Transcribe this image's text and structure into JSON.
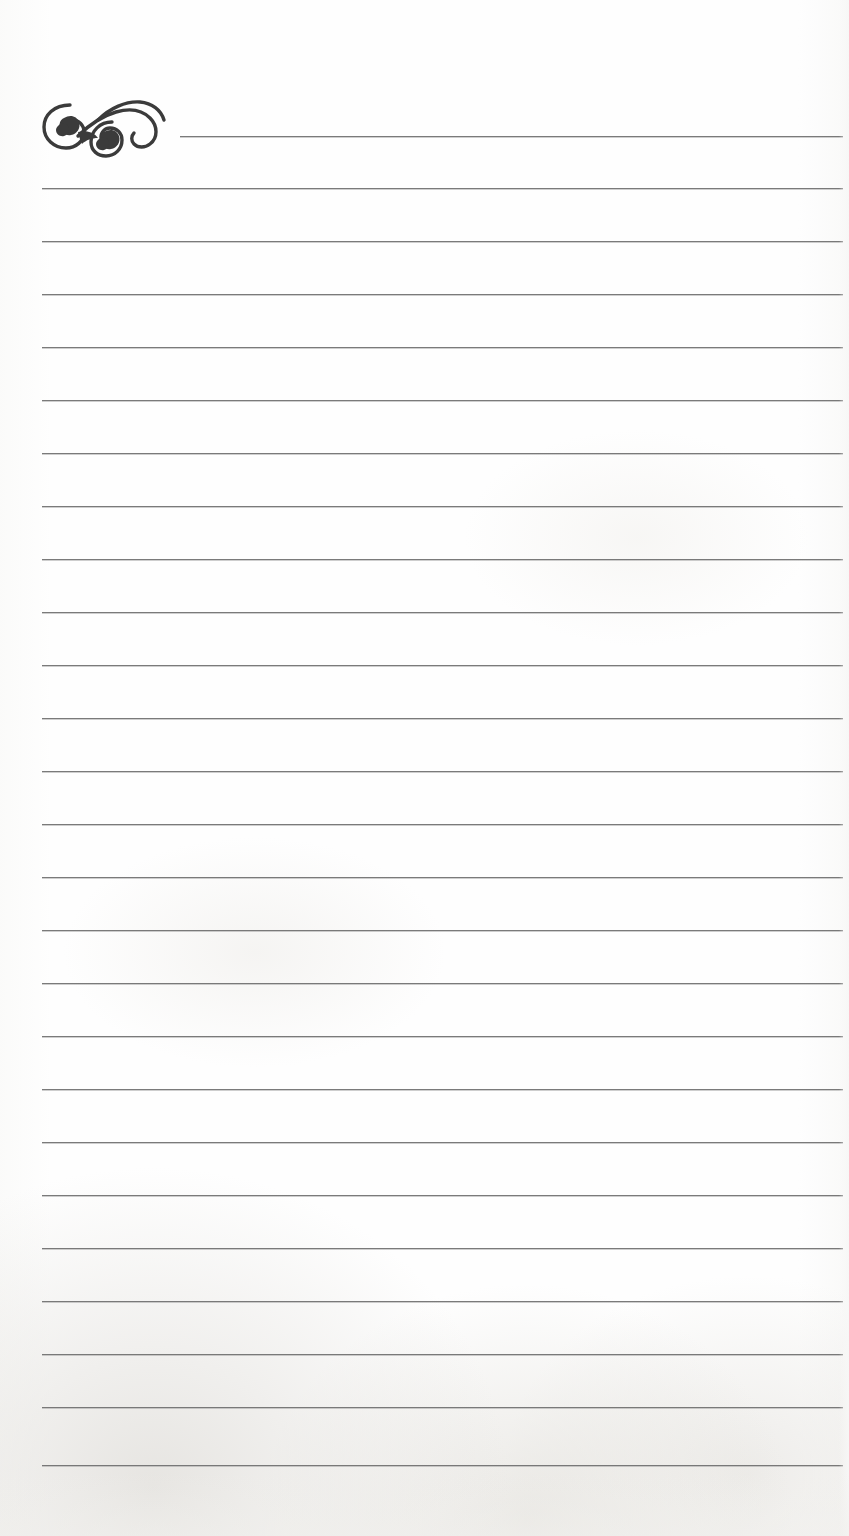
{
  "document": {
    "title": "Lined Notepaper",
    "type": "blank-ruled-writing-page",
    "background_color": "#fefefe",
    "rule_color": "#6f6f6f",
    "ornament_color": "#3b3b3b",
    "width": 849,
    "height": 1536
  },
  "ornament": {
    "name": "decorative-scroll-flourish",
    "description": "Double spiral scroll / filigree flourish with two curled bulbs",
    "x": 40,
    "y": 96,
    "width": 132,
    "height": 62
  },
  "rules": {
    "count": 26,
    "left_margin": 42,
    "right_margin": 843,
    "first_line_left": 180,
    "first_line_y": 136,
    "spacing": 53.2,
    "lines": [
      {
        "y": 136,
        "x1": 180,
        "x2": 843
      },
      {
        "y": 188,
        "x1": 42,
        "x2": 843
      },
      {
        "y": 241,
        "x1": 42,
        "x2": 843
      },
      {
        "y": 294,
        "x1": 42,
        "x2": 843
      },
      {
        "y": 347,
        "x1": 42,
        "x2": 843
      },
      {
        "y": 400,
        "x1": 42,
        "x2": 843
      },
      {
        "y": 453,
        "x1": 42,
        "x2": 843
      },
      {
        "y": 506,
        "x1": 42,
        "x2": 843
      },
      {
        "y": 559,
        "x1": 42,
        "x2": 843
      },
      {
        "y": 612,
        "x1": 42,
        "x2": 843
      },
      {
        "y": 665,
        "x1": 42,
        "x2": 843
      },
      {
        "y": 718,
        "x1": 42,
        "x2": 843
      },
      {
        "y": 771,
        "x1": 42,
        "x2": 843
      },
      {
        "y": 824,
        "x1": 42,
        "x2": 843
      },
      {
        "y": 877,
        "x1": 42,
        "x2": 843
      },
      {
        "y": 930,
        "x1": 42,
        "x2": 843
      },
      {
        "y": 983,
        "x1": 42,
        "x2": 843
      },
      {
        "y": 1036,
        "x1": 42,
        "x2": 843
      },
      {
        "y": 1089,
        "x1": 42,
        "x2": 843
      },
      {
        "y": 1142,
        "x1": 42,
        "x2": 843
      },
      {
        "y": 1195,
        "x1": 42,
        "x2": 843
      },
      {
        "y": 1248,
        "x1": 42,
        "x2": 843
      },
      {
        "y": 1301,
        "x1": 42,
        "x2": 843
      },
      {
        "y": 1354,
        "x1": 42,
        "x2": 843
      },
      {
        "y": 1407,
        "x1": 42,
        "x2": 843
      },
      {
        "y": 1465,
        "x1": 42,
        "x2": 843
      }
    ]
  },
  "content": {
    "text_lines": [],
    "note": "Page is blank; no handwritten or printed text present."
  }
}
